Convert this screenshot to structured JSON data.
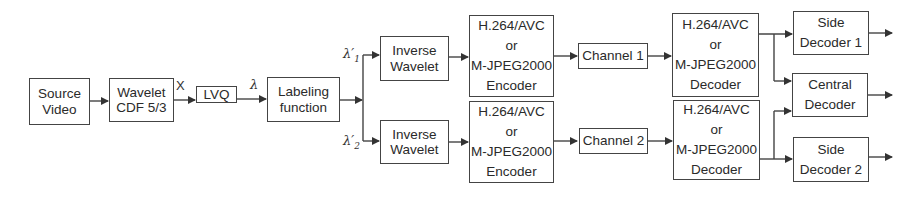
{
  "diagram": {
    "title": "",
    "blocks": {
      "source_video": [
        "Source",
        "Video"
      ],
      "wavelet": [
        "Wavelet",
        "CDF 5/3"
      ],
      "lvq": [
        "LVQ"
      ],
      "labeling": [
        "Labeling",
        "function"
      ],
      "inverse_wavelet_1": [
        "Inverse",
        "Wavelet"
      ],
      "inverse_wavelet_2": [
        "Inverse",
        "Wavelet"
      ],
      "encoder_1": [
        "H.264/AVC",
        "or",
        "M-JPEG2000",
        "Encoder"
      ],
      "encoder_2": [
        "H.264/AVC",
        "or",
        "M-JPEG2000",
        "Encoder"
      ],
      "channel_1": [
        "Channel 1"
      ],
      "channel_2": [
        "Channel 2"
      ],
      "decoder_1": [
        "H.264/AVC",
        "or",
        "M-JPEG2000",
        "Decoder"
      ],
      "decoder_2": [
        "H.264/AVC",
        "or",
        "M-JPEG2000",
        "Decoder"
      ],
      "side_decoder_1": [
        "Side",
        "Decoder 1"
      ],
      "central_decoder": [
        "Central",
        "Decoder"
      ],
      "side_decoder_2": [
        "Side",
        "Decoder 2"
      ]
    },
    "edge_labels": {
      "x": "X",
      "lambda": "λ",
      "lambda1": "λ′",
      "lambda1_sub": "1",
      "lambda2": "λ′",
      "lambda2_sub": "2"
    },
    "colors": {
      "stroke": "#444444",
      "text": "#2a2a2a",
      "background": "#ffffff"
    }
  }
}
